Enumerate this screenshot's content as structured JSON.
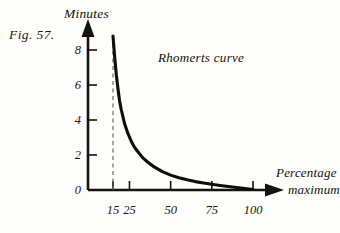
{
  "figure": {
    "number_label": "Fig. 57.",
    "background_color": "#fdfdfb",
    "ink_color": "#15120f"
  },
  "chart_data": {
    "type": "line",
    "title": "Rhomerts curve",
    "xlabel_line1": "Percentage",
    "xlabel_line2": "maximum",
    "ylabel": "Minutes",
    "xlim": [
      0,
      115
    ],
    "ylim": [
      0,
      9.4
    ],
    "grid": false,
    "legend": "none",
    "annotations": [
      {
        "name": "curve-name",
        "text": "Rhomerts curve",
        "x": 48,
        "y": 7.3
      },
      {
        "name": "asymptote",
        "type": "dashed-vertical-line",
        "x": 15,
        "y_from": 0,
        "y_to": 9.0
      }
    ],
    "x_ticks": [
      15,
      25,
      50,
      75,
      100
    ],
    "x_tick_labels": [
      "15",
      "25",
      "50",
      "75",
      "100"
    ],
    "y_ticks": [
      0,
      2,
      4,
      6,
      8
    ],
    "y_tick_labels": [
      "0",
      "2",
      "4",
      "6",
      "8"
    ],
    "series": [
      {
        "name": "Rhomerts curve",
        "x": [
          15,
          16,
          17,
          18,
          19,
          20,
          22,
          24,
          26,
          28,
          30,
          33,
          36,
          40,
          45,
          50,
          55,
          60,
          65,
          70,
          75,
          80,
          85,
          90,
          95,
          100
        ],
        "values": [
          8.8,
          7.6,
          6.6,
          5.8,
          5.1,
          4.6,
          3.8,
          3.25,
          2.8,
          2.45,
          2.2,
          1.85,
          1.6,
          1.32,
          1.05,
          0.85,
          0.7,
          0.58,
          0.48,
          0.4,
          0.33,
          0.26,
          0.2,
          0.14,
          0.08,
          0.03
        ]
      }
    ]
  },
  "axes": {
    "y_arrow": "up-arrow-icon",
    "x_arrow": "right-arrow-icon"
  }
}
